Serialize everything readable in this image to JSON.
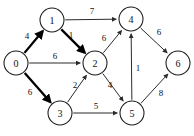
{
  "chart_data": {
    "type": "diagram",
    "subtype": "directed-weighted-graph",
    "title": "",
    "nodes": [
      {
        "id": "0",
        "label": "0",
        "x": 16,
        "y": 63,
        "r": 12
      },
      {
        "id": "1",
        "label": "1",
        "x": 52,
        "y": 20,
        "r": 12
      },
      {
        "id": "2",
        "label": "2",
        "x": 95,
        "y": 63,
        "r": 12
      },
      {
        "id": "3",
        "label": "3",
        "x": 60,
        "y": 113,
        "r": 12
      },
      {
        "id": "4",
        "label": "4",
        "x": 131,
        "y": 19,
        "r": 12
      },
      {
        "id": "5",
        "label": "5",
        "x": 132,
        "y": 113,
        "r": 12
      },
      {
        "id": "6",
        "label": "6",
        "x": 178,
        "y": 63,
        "r": 12
      }
    ],
    "edges": [
      {
        "from": "0",
        "to": "1",
        "weight": "4",
        "highlighted": true,
        "label_x": 27,
        "label_y": 36
      },
      {
        "from": "0",
        "to": "2",
        "weight": "6",
        "highlighted": false,
        "label_x": 55,
        "label_y": 56
      },
      {
        "from": "0",
        "to": "3",
        "weight": "6",
        "highlighted": true,
        "label_x": 30,
        "label_y": 92
      },
      {
        "from": "1",
        "to": "2",
        "weight": "1",
        "highlighted": true,
        "label_x": 71,
        "label_y": 35
      },
      {
        "from": "1",
        "to": "4",
        "weight": "7",
        "highlighted": false,
        "label_x": 92,
        "label_y": 11
      },
      {
        "from": "2",
        "to": "4",
        "weight": "6",
        "highlighted": false,
        "label_x": 104,
        "label_y": 38
      },
      {
        "from": "2",
        "to": "5",
        "weight": "4",
        "highlighted": false,
        "label_x": 110,
        "label_y": 85
      },
      {
        "from": "3",
        "to": "2",
        "weight": "2",
        "highlighted": false,
        "label_x": 75,
        "label_y": 85
      },
      {
        "from": "3",
        "to": "5",
        "weight": "5",
        "highlighted": false,
        "label_x": 96,
        "label_y": 106
      },
      {
        "from": "4",
        "to": "6",
        "weight": "6",
        "highlighted": false,
        "label_x": 159,
        "label_y": 32
      },
      {
        "from": "5",
        "to": "4",
        "weight": "1",
        "highlighted": false,
        "label_x": 138,
        "label_y": 68
      },
      {
        "from": "5",
        "to": "6",
        "weight": "8",
        "highlighted": false,
        "label_x": 161,
        "label_y": 93
      }
    ],
    "legend": [],
    "xlabel": "",
    "ylabel": ""
  }
}
